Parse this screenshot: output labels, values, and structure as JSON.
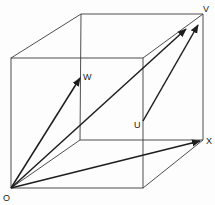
{
  "diagram": {
    "type": "vector-cube",
    "labels": {
      "origin": "O",
      "w": "W",
      "v": "V",
      "u": "U",
      "x": "X"
    },
    "colors": {
      "edge": "#3a3a3a",
      "arrow": "#1e1e1e",
      "label": "#222222",
      "background": "#fdfdfd"
    },
    "vectors": [
      {
        "from": "O",
        "to": "W"
      },
      {
        "from": "O",
        "to": "V"
      },
      {
        "from": "U",
        "to": "V"
      },
      {
        "from": "O",
        "to": "X"
      }
    ]
  }
}
